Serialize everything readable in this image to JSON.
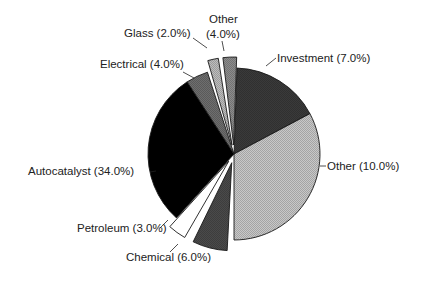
{
  "chart_data": {
    "type": "pie",
    "title": "",
    "unit": "%",
    "slices": [
      {
        "label": "Investment",
        "value": 7.0,
        "display": "Investment (7.0%)",
        "color": "#3a3a3a",
        "exploded": false
      },
      {
        "label": "Other",
        "value": 10.0,
        "display": "Other (10.0%)",
        "color": "#c8c8c8",
        "exploded": false
      },
      {
        "label": "Chemical",
        "value": 6.0,
        "display": "Chemical (6.0%)",
        "color": "#4a4a4a",
        "exploded": true
      },
      {
        "label": "Petroleum",
        "value": 3.0,
        "display": "Petroleum (3.0%)",
        "color": "#ffffff",
        "exploded": true
      },
      {
        "label": "Autocatalyst",
        "value": 34.0,
        "display": "Autocatalyst (34.0%)",
        "color": "#000000",
        "exploded": false
      },
      {
        "label": "Electrical",
        "value": 4.0,
        "display": "Electrical (4.0%)",
        "color": "#6e6e6e",
        "exploded": false
      },
      {
        "label": "Glass",
        "value": 2.0,
        "display": "Glass (2.0%)",
        "color": "#bdbdbd",
        "exploded": true
      },
      {
        "label": "Other",
        "value": 4.0,
        "display_line1": "Other",
        "display_line2": "(4.0%)",
        "color": "#8c8c8c",
        "exploded": true
      }
    ],
    "legend": "none (labels with leader lines)"
  }
}
